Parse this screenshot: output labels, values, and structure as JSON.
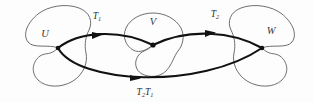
{
  "figure": {
    "background_color": "#fdfdfd",
    "outline_color": "#5d5d5d",
    "arc_color": "#111111",
    "width": 314,
    "height": 102
  },
  "sets": [
    {
      "id": "U",
      "label": "U",
      "label_x": 45,
      "label_y": 35
    },
    {
      "id": "V",
      "label": "V",
      "label_x": 153,
      "label_y": 23
    },
    {
      "id": "W",
      "label": "W",
      "label_x": 271,
      "label_y": 32
    }
  ],
  "nodes": [
    {
      "id": "u-point",
      "set": "U",
      "x": 58,
      "y": 48
    },
    {
      "id": "v-point",
      "set": "V",
      "x": 153,
      "y": 45
    },
    {
      "id": "w-point",
      "set": "W",
      "x": 262,
      "y": 48
    }
  ],
  "maps": [
    {
      "id": "T1",
      "base": "T",
      "subscript": "1",
      "from": "U",
      "to": "V",
      "label_x": 97,
      "label_y": 17,
      "arrow_x": 98,
      "arrow_y": 36
    },
    {
      "id": "T2",
      "base": "T",
      "subscript": "2",
      "from": "V",
      "to": "W",
      "label_x": 215,
      "label_y": 15,
      "arrow_x": 211,
      "arrow_y": 34
    },
    {
      "id": "T2T1",
      "base": "T",
      "subscript": "2",
      "base2": "T",
      "subscript2": "1",
      "from": "U",
      "to": "W",
      "label_x": 145,
      "label_y": 93,
      "arrow_x": 136,
      "arrow_y": 78
    }
  ]
}
